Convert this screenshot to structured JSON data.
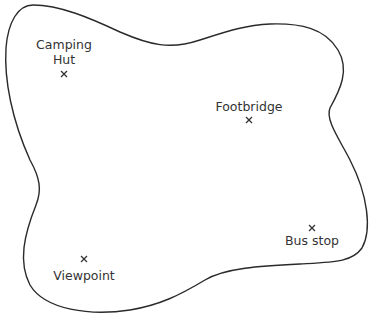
{
  "diagram": {
    "type": "map-outline",
    "outline_color": "#2a2a2a",
    "text_color": "#333333",
    "locations": [
      {
        "name": "Camping Hut",
        "lines": [
          "Camping",
          "Hut"
        ],
        "marker": "x"
      },
      {
        "name": "Footbridge",
        "lines": [
          "Footbridge"
        ],
        "marker": "x"
      },
      {
        "name": "Viewpoint",
        "lines": [
          "Viewpoint"
        ],
        "marker": "x"
      },
      {
        "name": "Bus stop",
        "lines": [
          "Bus stop"
        ],
        "marker": "x"
      }
    ]
  }
}
